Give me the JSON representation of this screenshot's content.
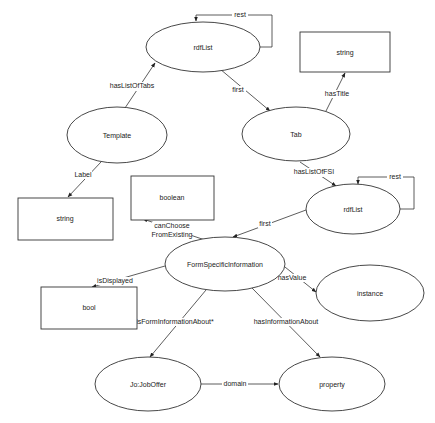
{
  "diagram": {
    "nodes": [
      {
        "id": "rdflist_top",
        "label": "rdfList",
        "shape": "ellipse"
      },
      {
        "id": "string_title",
        "label": "string",
        "shape": "rect"
      },
      {
        "id": "template",
        "label": "Template",
        "shape": "ellipse"
      },
      {
        "id": "tab",
        "label": "Tab",
        "shape": "ellipse"
      },
      {
        "id": "string_label",
        "label": "string",
        "shape": "rect"
      },
      {
        "id": "boolean",
        "label": "boolean",
        "shape": "rect"
      },
      {
        "id": "rdflist_fsi",
        "label": "rdfList",
        "shape": "ellipse"
      },
      {
        "id": "fsi",
        "label": "FormSpecificInformation",
        "shape": "ellipse"
      },
      {
        "id": "bool",
        "label": "bool",
        "shape": "rect"
      },
      {
        "id": "instance",
        "label": "instance",
        "shape": "ellipse"
      },
      {
        "id": "joboffer",
        "label": "Jo:JobOffer",
        "shape": "ellipse"
      },
      {
        "id": "property",
        "label": "property",
        "shape": "ellipse"
      }
    ],
    "edges": [
      {
        "from": "rdflist_top",
        "to": "rdflist_top",
        "label": "rest"
      },
      {
        "from": "template",
        "to": "rdflist_top",
        "label": "hasListOfTabs"
      },
      {
        "from": "rdflist_top",
        "to": "tab",
        "label": "first"
      },
      {
        "from": "tab",
        "to": "string_title",
        "label": "hasTitle"
      },
      {
        "from": "template",
        "to": "string_label",
        "label": "Label"
      },
      {
        "from": "tab",
        "to": "rdflist_fsi",
        "label": "hasListOfFSI"
      },
      {
        "from": "rdflist_fsi",
        "to": "rdflist_fsi",
        "label": "rest"
      },
      {
        "from": "rdflist_fsi",
        "to": "fsi",
        "label": "first"
      },
      {
        "from": "fsi",
        "to": "boolean",
        "label": "canChoose FromExisting",
        "label_lines": [
          "canChoose",
          "FromExisting"
        ]
      },
      {
        "from": "fsi",
        "to": "bool",
        "label": "isDisplayed"
      },
      {
        "from": "fsi",
        "to": "instance",
        "label": "hasValue"
      },
      {
        "from": "fsi",
        "to": "joboffer",
        "label": "isFormInformationAbout*"
      },
      {
        "from": "fsi",
        "to": "property",
        "label": "hasInformationAbout"
      },
      {
        "from": "joboffer",
        "to": "property",
        "label": "domain"
      }
    ]
  }
}
